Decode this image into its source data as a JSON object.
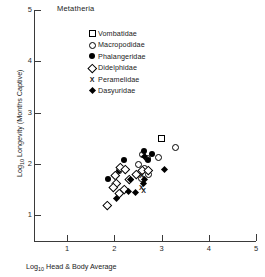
{
  "chart_data": {
    "type": "scatter",
    "title": "Metatheria",
    "xlabel": "Log10 Head & Body Average",
    "ylabel": "Log10 Longevity (Months Captive)",
    "xlabel_prefix": "Log",
    "xlabel_sub": "10",
    "xlabel_rest": " Head & Body Average",
    "ylabel_prefix": "Log",
    "ylabel_sub": "10",
    "ylabel_rest": " Longevity (Months Captive)",
    "xlim": [
      0.3,
      5.0
    ],
    "ylim": [
      0.5,
      5.0
    ],
    "xticks": [
      1,
      2,
      3,
      4,
      5
    ],
    "yticks": [
      1,
      2,
      3,
      4,
      5
    ],
    "grid": false,
    "legend_position": "upper-center",
    "series": [
      {
        "name": "Vombatidae",
        "marker": "open-square",
        "points": [
          [
            3.0,
            2.5
          ]
        ]
      },
      {
        "name": "Macropodidae",
        "marker": "open-circle",
        "points": [
          [
            3.3,
            2.32
          ],
          [
            2.93,
            2.12
          ],
          [
            2.7,
            2.1
          ],
          [
            2.6,
            2.18
          ],
          [
            2.52,
            2.0
          ],
          [
            2.63,
            1.92
          ],
          [
            2.72,
            1.8
          ],
          [
            2.57,
            1.72
          ]
        ]
      },
      {
        "name": "Phalangeridae",
        "marker": "filled-circle",
        "points": [
          [
            2.62,
            2.25
          ],
          [
            2.8,
            2.2
          ],
          [
            2.72,
            2.07
          ],
          [
            2.2,
            2.07
          ],
          [
            2.1,
            1.86
          ],
          [
            1.86,
            1.7
          ]
        ]
      },
      {
        "name": "Didelphidae",
        "marker": "open-diamond",
        "points": [
          [
            2.12,
            1.93
          ],
          [
            2.23,
            1.9
          ],
          [
            2.02,
            1.78
          ],
          [
            2.6,
            1.87
          ],
          [
            2.72,
            1.88
          ],
          [
            2.46,
            1.8
          ],
          [
            2.32,
            1.7
          ],
          [
            2.05,
            1.62
          ],
          [
            1.97,
            1.55
          ],
          [
            2.22,
            1.5
          ],
          [
            2.1,
            1.42
          ],
          [
            1.85,
            1.2
          ]
        ]
      },
      {
        "name": "Peramelidae",
        "marker": "x",
        "points": [
          [
            2.58,
            1.78
          ],
          [
            2.57,
            1.55
          ],
          [
            2.62,
            1.48
          ]
        ]
      },
      {
        "name": "Dasyuridae",
        "marker": "filled-diamond",
        "points": [
          [
            2.66,
            2.12
          ],
          [
            3.08,
            1.88
          ],
          [
            2.67,
            1.68
          ],
          [
            2.64,
            1.6
          ],
          [
            2.36,
            1.67
          ],
          [
            2.47,
            1.42
          ],
          [
            2.32,
            1.45
          ],
          [
            2.07,
            1.3
          ]
        ]
      }
    ]
  }
}
